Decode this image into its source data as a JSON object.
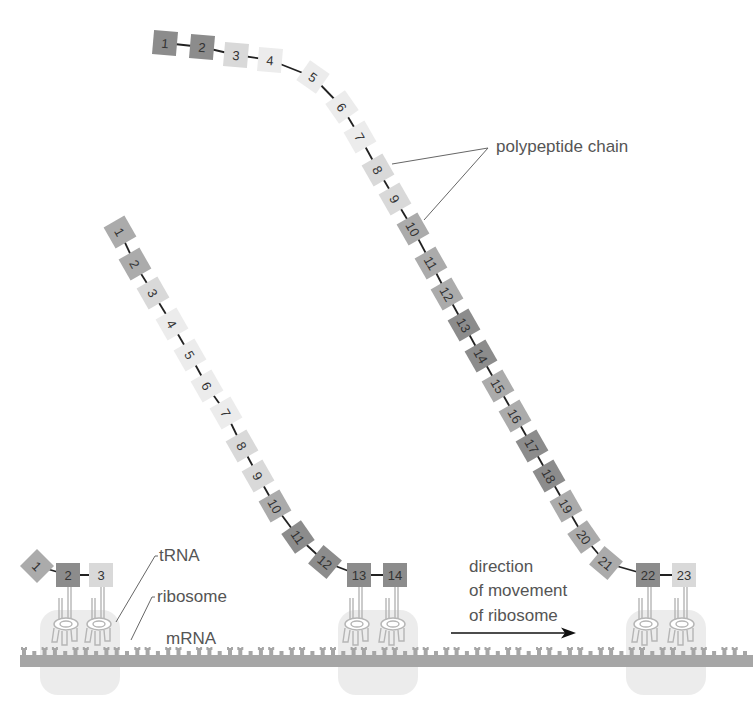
{
  "diagram": {
    "labels": {
      "polypeptide": "polypeptide chain",
      "trna": "tRNA",
      "ribosome": "ribosome",
      "mrna": "mRNA",
      "direction_line1": "direction",
      "direction_line2": "of movement",
      "direction_line3": "of ribosome"
    },
    "colors": {
      "dark": "#8c8c8c",
      "medium": "#ababab",
      "light": "#d9d9d9",
      "pale": "#ececec",
      "mrna": "#a6a6a6",
      "ribosome": "#ececec",
      "trna_stroke": "#b5b5b5",
      "text": "#555555",
      "bond": "#222222"
    },
    "chains": [
      {
        "name": "chain-ribosome-1",
        "amino_acids": [
          {
            "n": "1",
            "x": 37,
            "y": 566,
            "rot": 45,
            "shade": "medium"
          },
          {
            "n": "2",
            "x": 68,
            "y": 575,
            "rot": 0,
            "shade": "dark"
          },
          {
            "n": "3",
            "x": 101,
            "y": 575,
            "rot": 0,
            "shade": "light"
          }
        ]
      },
      {
        "name": "chain-ribosome-2",
        "amino_acids": [
          {
            "n": "1",
            "x": 120,
            "y": 232,
            "rot": 60,
            "shade": "medium"
          },
          {
            "n": "2",
            "x": 135,
            "y": 264,
            "rot": 60,
            "shade": "medium"
          },
          {
            "n": "3",
            "x": 153,
            "y": 293,
            "rot": 60,
            "shade": "light"
          },
          {
            "n": "4",
            "x": 172,
            "y": 324,
            "rot": 60,
            "shade": "pale"
          },
          {
            "n": "5",
            "x": 190,
            "y": 355,
            "rot": 60,
            "shade": "pale"
          },
          {
            "n": "6",
            "x": 207,
            "y": 386,
            "rot": 60,
            "shade": "pale"
          },
          {
            "n": "7",
            "x": 226,
            "y": 413,
            "rot": 60,
            "shade": "pale"
          },
          {
            "n": "8",
            "x": 242,
            "y": 446,
            "rot": 60,
            "shade": "light"
          },
          {
            "n": "9",
            "x": 258,
            "y": 476,
            "rot": 60,
            "shade": "light"
          },
          {
            "n": "10",
            "x": 275,
            "y": 506,
            "rot": 60,
            "shade": "medium"
          },
          {
            "n": "11",
            "x": 298,
            "y": 537,
            "rot": 55,
            "shade": "dark"
          },
          {
            "n": "12",
            "x": 325,
            "y": 562,
            "rot": 40,
            "shade": "dark"
          },
          {
            "n": "13",
            "x": 359,
            "y": 575,
            "rot": 0,
            "shade": "dark"
          },
          {
            "n": "14",
            "x": 395,
            "y": 575,
            "rot": 0,
            "shade": "dark"
          }
        ]
      },
      {
        "name": "chain-ribosome-3",
        "amino_acids": [
          {
            "n": "1",
            "x": 165,
            "y": 43,
            "rot": 5,
            "shade": "dark"
          },
          {
            "n": "2",
            "x": 202,
            "y": 47,
            "rot": 5,
            "shade": "dark"
          },
          {
            "n": "3",
            "x": 236,
            "y": 55,
            "rot": 5,
            "shade": "light"
          },
          {
            "n": "4",
            "x": 270,
            "y": 60,
            "rot": 5,
            "shade": "pale"
          },
          {
            "n": "5",
            "x": 313,
            "y": 77,
            "rot": 35,
            "shade": "pale"
          },
          {
            "n": "6",
            "x": 342,
            "y": 107,
            "rot": 55,
            "shade": "pale"
          },
          {
            "n": "7",
            "x": 360,
            "y": 137,
            "rot": 60,
            "shade": "pale"
          },
          {
            "n": "8",
            "x": 378,
            "y": 170,
            "rot": 60,
            "shade": "light"
          },
          {
            "n": "9",
            "x": 395,
            "y": 199,
            "rot": 60,
            "shade": "light"
          },
          {
            "n": "10",
            "x": 413,
            "y": 229,
            "rot": 60,
            "shade": "medium"
          },
          {
            "n": "11",
            "x": 431,
            "y": 263,
            "rot": 60,
            "shade": "medium"
          },
          {
            "n": "12",
            "x": 447,
            "y": 294,
            "rot": 60,
            "shade": "medium"
          },
          {
            "n": "13",
            "x": 464,
            "y": 325,
            "rot": 60,
            "shade": "dark"
          },
          {
            "n": "14",
            "x": 481,
            "y": 356,
            "rot": 60,
            "shade": "dark"
          },
          {
            "n": "15",
            "x": 498,
            "y": 386,
            "rot": 60,
            "shade": "medium"
          },
          {
            "n": "16",
            "x": 515,
            "y": 416,
            "rot": 60,
            "shade": "medium"
          },
          {
            "n": "17",
            "x": 532,
            "y": 446,
            "rot": 60,
            "shade": "dark"
          },
          {
            "n": "18",
            "x": 549,
            "y": 476,
            "rot": 60,
            "shade": "dark"
          },
          {
            "n": "19",
            "x": 566,
            "y": 506,
            "rot": 60,
            "shade": "medium"
          },
          {
            "n": "20",
            "x": 584,
            "y": 537,
            "rot": 55,
            "shade": "medium"
          },
          {
            "n": "21",
            "x": 606,
            "y": 563,
            "rot": 40,
            "shade": "medium"
          },
          {
            "n": "22",
            "x": 648,
            "y": 575,
            "rot": 0,
            "shade": "dark"
          },
          {
            "n": "23",
            "x": 684,
            "y": 575,
            "rot": 0,
            "shade": "light"
          }
        ]
      }
    ],
    "ribosomes": [
      {
        "name": "ribosome-1",
        "x": 80,
        "trna_x": [
          68,
          101
        ]
      },
      {
        "name": "ribosome-2",
        "x": 378,
        "trna_x": [
          359,
          395
        ]
      },
      {
        "name": "ribosome-3",
        "x": 666,
        "trna_x": [
          648,
          684
        ]
      }
    ]
  }
}
